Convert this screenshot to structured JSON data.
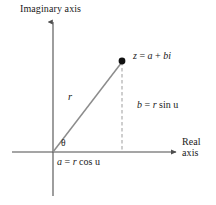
{
  "figure": {
    "colors": {
      "axis": "#4d4d4d",
      "ray": "#8c8c8c",
      "dashed": "#a6a6a6",
      "point": "#111111",
      "text": "#1a1a1a",
      "background": "#ffffff"
    },
    "axes": {
      "imaginary_label": "Imaginary axis",
      "real_label_line1": "Real",
      "real_label_line2": "axis"
    },
    "labels": {
      "point_label": "z = a + bi",
      "point_label_parts": {
        "z": "z",
        "equals": "=",
        "a": "a",
        "plus": "+",
        "b": "b",
        "i": "i"
      },
      "radius": "r",
      "angle": "θ",
      "imaginary_part": "b = r sin u",
      "imaginary_part_parts": {
        "b": "b",
        "equals": "=",
        "r": "r",
        "fn": "sin",
        "angle": "u"
      },
      "real_part": "a = r cos u",
      "real_part_parts": {
        "a": "a",
        "equals": "=",
        "r": "r",
        "fn": "cos",
        "angle": "u"
      }
    },
    "geometry": {
      "origin_x": 53,
      "origin_y": 152,
      "point_x": 122,
      "point_y": 61,
      "real_axis_start_x": 12,
      "real_axis_end_x": 179,
      "imaginary_axis_top_y": 20,
      "imaginary_axis_bottom_y": 196
    }
  }
}
